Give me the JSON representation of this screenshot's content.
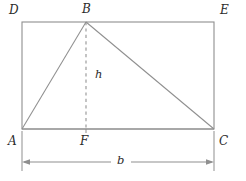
{
  "figure": {
    "kind": "geometry-diagram",
    "width": 246,
    "height": 181,
    "background_color": "#ffffff",
    "line_color": "#8a8a8a",
    "text_color": "#2b2b2b"
  },
  "labels": {
    "D": "D",
    "B": "B",
    "E": "E",
    "A": "A",
    "F": "F",
    "C": "C",
    "height": "h",
    "base": "b"
  },
  "geometry": {
    "rectangle": {
      "name": "ADEC",
      "left": 22,
      "top": 22,
      "right": 214,
      "bottom": 129,
      "corners": {
        "D": [
          22,
          22
        ],
        "E": [
          214,
          22
        ],
        "C": [
          214,
          129
        ],
        "A": [
          22,
          129
        ]
      }
    },
    "triangle": {
      "name": "ABC",
      "points": {
        "A": [
          22,
          129
        ],
        "B": [
          86,
          22
        ],
        "C": [
          214,
          129
        ]
      }
    },
    "altitude": {
      "from": "B",
      "to": "F",
      "points": {
        "B": [
          86,
          22
        ],
        "F": [
          86,
          129
        ]
      },
      "style": "dashed",
      "label": "h"
    },
    "dimension": {
      "label": "b",
      "axis": "horizontal",
      "y": 162,
      "x_start": 22,
      "x_end": 214,
      "extension_lines": [
        {
          "x": 22,
          "y_start": 129,
          "y_end": 171
        },
        {
          "x": 214,
          "y_start": 129,
          "y_end": 171
        }
      ],
      "arrowheads": [
        "start",
        "end"
      ]
    }
  }
}
